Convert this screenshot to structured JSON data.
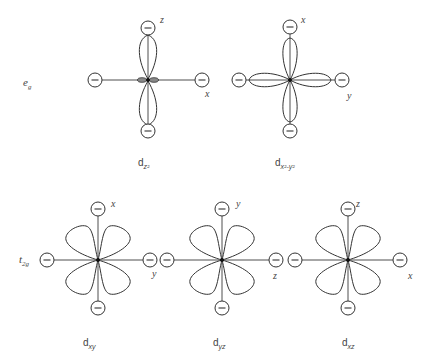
{
  "diagram": {
    "groups": [
      {
        "id": "eg",
        "label": "e",
        "label_sub": "g"
      },
      {
        "id": "t2g",
        "label": "t",
        "label_sub": "2g"
      }
    ],
    "orbitals": [
      {
        "id": "dz2",
        "group": "eg",
        "name": "d",
        "sub": "z²",
        "axis_vertical": "z",
        "axis_horizontal": "x",
        "ligand_charge": "−",
        "shape": "dumbbell-with-torus"
      },
      {
        "id": "dx2y2",
        "group": "eg",
        "name": "d",
        "sub": "x²-y²",
        "axis_vertical": "x",
        "axis_horizontal": "y",
        "ligand_charge": "−",
        "shape": "four-lobes-on-axes"
      },
      {
        "id": "dxy",
        "group": "t2g",
        "name": "d",
        "sub": "xy",
        "axis_vertical": "x",
        "axis_horizontal": "y",
        "ligand_charge": "−",
        "shape": "four-lobes-between-axes"
      },
      {
        "id": "dyz",
        "group": "t2g",
        "name": "d",
        "sub": "yz",
        "axis_vertical": "y",
        "axis_horizontal": "z",
        "ligand_charge": "−",
        "shape": "four-lobes-between-axes"
      },
      {
        "id": "dxz",
        "group": "t2g",
        "name": "d",
        "sub": "xz",
        "axis_vertical": "z",
        "axis_horizontal": "x",
        "ligand_charge": "−",
        "shape": "four-lobes-between-axes"
      }
    ],
    "colors": {
      "line": "#333333",
      "background": "#ffffff",
      "text": "#444444"
    }
  }
}
